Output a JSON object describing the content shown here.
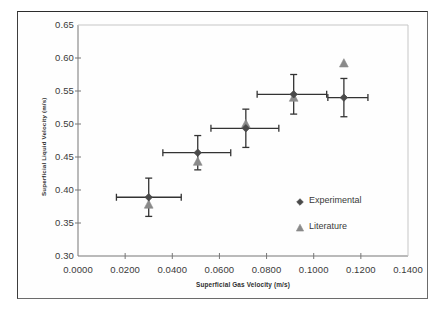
{
  "chart_data": {
    "type": "scatter",
    "title": "",
    "xlabel": "Superficial Gas Velocity (m/s)",
    "ylabel": "Superficial Liquid Velocity (m/s)",
    "xlim": [
      0.0,
      0.14
    ],
    "ylim": [
      0.3,
      0.65
    ],
    "xticks": [
      0.0,
      0.02,
      0.04,
      0.06,
      0.08,
      0.1,
      0.12,
      0.14
    ],
    "yticks": [
      0.3,
      0.35,
      0.4,
      0.45,
      0.5,
      0.55,
      0.6,
      0.65
    ],
    "xtick_labels": [
      "0.0000",
      "0.0200",
      "0.0400",
      "0.0600",
      "0.0800",
      "0.1000",
      "0.1200",
      "0.1400"
    ],
    "ytick_labels": [
      "0.30",
      "0.35",
      "0.40",
      "0.45",
      "0.50",
      "0.55",
      "0.60",
      "0.65"
    ],
    "grid": false,
    "legend_position": "inside-lower-right",
    "marker_color": "#4a4a4a",
    "literature_color": "#8a8a8a",
    "errorbar_color": "#333333",
    "series": [
      {
        "name": "Experimental",
        "marker": "diamond",
        "points": [
          {
            "x": 0.03,
            "y": 0.389,
            "xerr_low": 0.0137,
            "xerr_high": 0.0138,
            "yerr_low": 0.029,
            "yerr_high": 0.029
          },
          {
            "x": 0.0508,
            "y": 0.4565,
            "xerr_low": 0.0148,
            "xerr_high": 0.014,
            "yerr_low": 0.026,
            "yerr_high": 0.026
          },
          {
            "x": 0.0712,
            "y": 0.4935,
            "xerr_low": 0.0148,
            "xerr_high": 0.014,
            "yerr_low": 0.029,
            "yerr_high": 0.029
          },
          {
            "x": 0.0915,
            "y": 0.545,
            "xerr_low": 0.0155,
            "xerr_high": 0.014,
            "yerr_low": 0.03,
            "yerr_high": 0.03
          },
          {
            "x": 0.1128,
            "y": 0.54,
            "xerr_low": 0.0068,
            "xerr_high": 0.0102,
            "yerr_low": 0.029,
            "yerr_high": 0.029
          }
        ]
      },
      {
        "name": "Literature",
        "marker": "triangle",
        "points": [
          {
            "x": 0.03,
            "y": 0.378
          },
          {
            "x": 0.0508,
            "y": 0.443
          },
          {
            "x": 0.0712,
            "y": 0.5
          },
          {
            "x": 0.0915,
            "y": 0.54
          },
          {
            "x": 0.1128,
            "y": 0.592
          }
        ]
      }
    ],
    "legend": [
      {
        "label": "Experimental",
        "marker": "diamond",
        "color": "#4a4a4a"
      },
      {
        "label": "Literature",
        "marker": "triangle",
        "color": "#8a8a8a"
      }
    ]
  }
}
